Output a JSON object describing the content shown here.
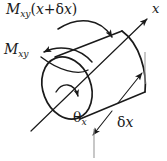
{
  "figure": {
    "type": "mechanics-free-body-diagram",
    "stroke_color": "#1a1a1a",
    "background_color": "#ffffff"
  },
  "labels": {
    "moment_right": {
      "name": "M_xy(x+dx)",
      "base": "M",
      "subscript": "xy",
      "paren_open": "(",
      "arg_var": "x",
      "plus": "+",
      "delta": "δ",
      "arg_var2": "x",
      "paren_close": ")"
    },
    "moment_left": {
      "name": "M_xy",
      "base": "M",
      "subscript": "xy"
    },
    "theta": {
      "name": "theta_x",
      "base": "θ",
      "subscript": "x"
    },
    "delta_x": {
      "name": "delta x",
      "delta": "δ",
      "var": "x"
    },
    "axis_x": {
      "name": "x-axis",
      "text": "x"
    }
  },
  "geometry": {
    "cylinder": {
      "left_face_center": [
        66,
        88
      ],
      "left_face_rx": 25,
      "left_face_ry": 33,
      "left_face_rotation_deg": -28,
      "right_edge_center": [
        133,
        62
      ],
      "right_edge_rx": 15,
      "right_edge_ry": 33,
      "right_edge_rotation_deg": -28
    },
    "axis_line": {
      "from": [
        30,
        130
      ],
      "to": [
        150,
        18
      ]
    },
    "dimension_line": {
      "from": [
        94,
        134
      ],
      "to": [
        143,
        72
      ]
    }
  },
  "icons": {
    "arrow_moment_top": "curved-arrow-icon",
    "arrow_moment_left": "curved-arrow-icon",
    "arrow_theta": "curved-arrow-icon",
    "arrow_axis": "arrowhead-icon",
    "arrow_dimension_upper": "arrowhead-icon",
    "arrow_dimension_lower": "arrowhead-icon"
  }
}
